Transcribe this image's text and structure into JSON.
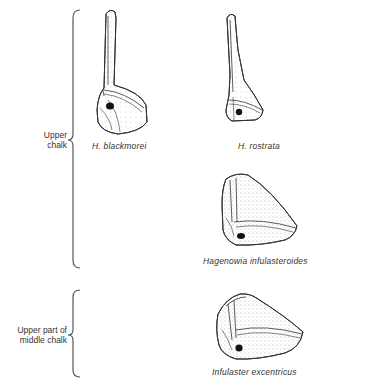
{
  "figure": {
    "zones": [
      {
        "id": "upper-chalk",
        "label_lines": [
          "Upper",
          "chalk"
        ],
        "bracket": {
          "top": 10,
          "tip": 140,
          "bottom": 268
        }
      },
      {
        "id": "middle-chalk",
        "label_lines": [
          "Upper part of",
          "middle chalk"
        ],
        "bracket": {
          "top": 290,
          "tip": 335,
          "bottom": 377
        }
      }
    ],
    "species": [
      {
        "id": "h-blackmorei",
        "label": "H. blackmorei",
        "zone": "upper-chalk"
      },
      {
        "id": "h-rostrata",
        "label": "H. rostrata",
        "zone": "upper-chalk"
      },
      {
        "id": "hagenowia-infulasteroides",
        "label": "Hagenowia infulasteroides",
        "zone": "upper-chalk"
      },
      {
        "id": "infulaster-excentricus",
        "label": "Infulaster excentricus",
        "zone": "middle-chalk"
      }
    ],
    "colors": {
      "line": "#3a3a3a",
      "stipple": "#6a6a6a",
      "background": "#ffffff",
      "spot": "#111111"
    }
  }
}
